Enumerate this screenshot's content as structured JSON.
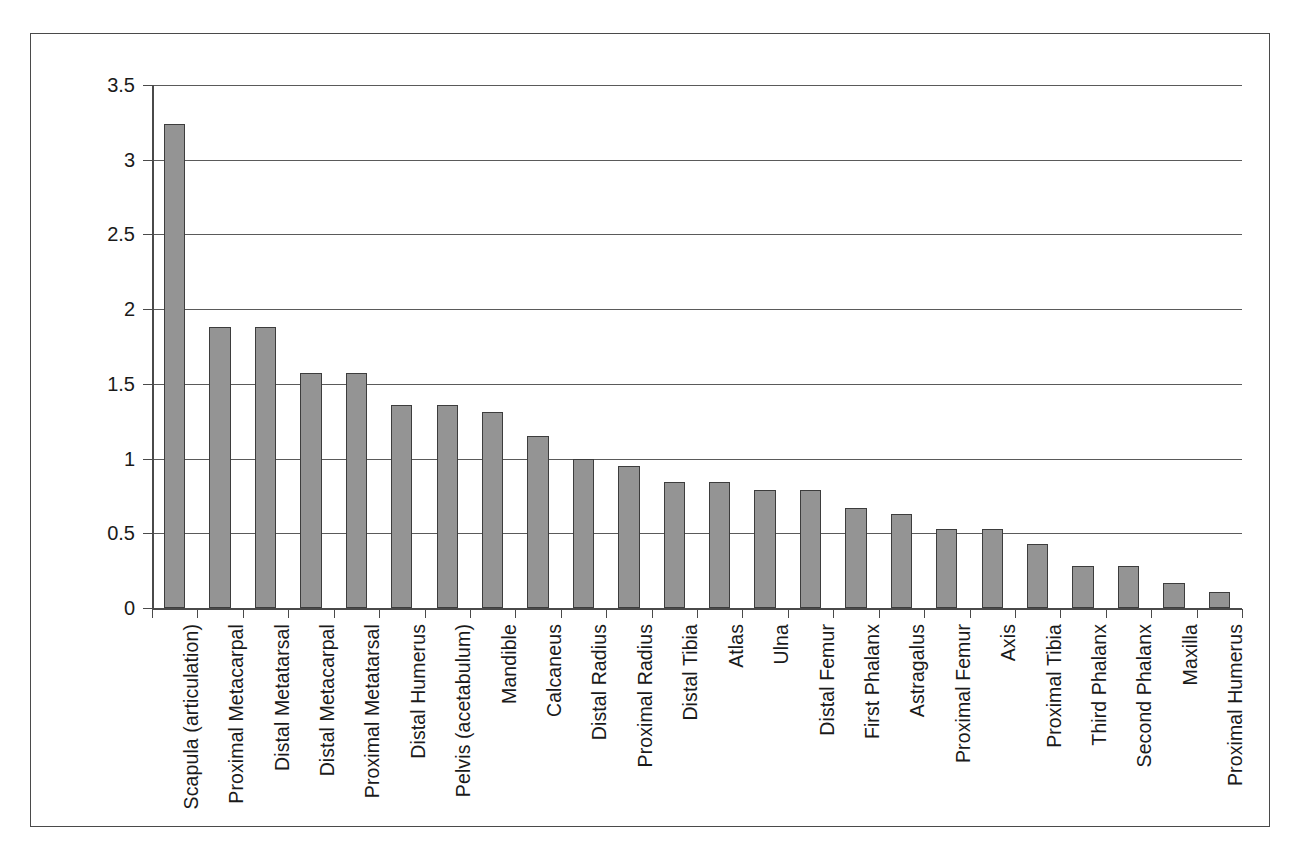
{
  "chart_data": {
    "type": "bar",
    "title": "",
    "subtitle": "",
    "xlabel": "",
    "ylabel": "",
    "ylim": [
      0,
      3.5
    ],
    "yticks": [
      "0",
      "0.5",
      "1",
      "1.5",
      "2",
      "2.5",
      "3",
      "3.5"
    ],
    "ytick_values": [
      0,
      0.5,
      1,
      1.5,
      2,
      2.5,
      3,
      3.5
    ],
    "grid": "horizontal",
    "legend": "none",
    "bar_color": "#949494",
    "bar_edge_color": "#3d3d3d",
    "axis_color": "#4a4a4a",
    "categories": [
      "Scapula (articulation)",
      "Proximal Metacarpal",
      "Distal Metatarsal",
      "Distal Metacarpal",
      "Proximal Metatarsal",
      "Distal Humerus",
      "Pelvis (acetabulum)",
      "Mandible",
      "Calcaneus",
      "Distal Radius",
      "Proximal Radius",
      "Distal Tibia",
      "Atlas",
      "Ulna",
      "Distal Femur",
      "First Phalanx",
      "Astragalus",
      "Proximal Femur",
      "Axis",
      "Proximal Tibia",
      "Third Phalanx",
      "Second Phalanx",
      "Maxilla",
      "Proximal Humerus"
    ],
    "values": [
      3.24,
      1.88,
      1.88,
      1.57,
      1.57,
      1.36,
      1.36,
      1.31,
      1.15,
      1.0,
      0.95,
      0.84,
      0.84,
      0.79,
      0.79,
      0.67,
      0.63,
      0.53,
      0.53,
      0.43,
      0.28,
      0.28,
      0.17,
      0.11
    ]
  }
}
